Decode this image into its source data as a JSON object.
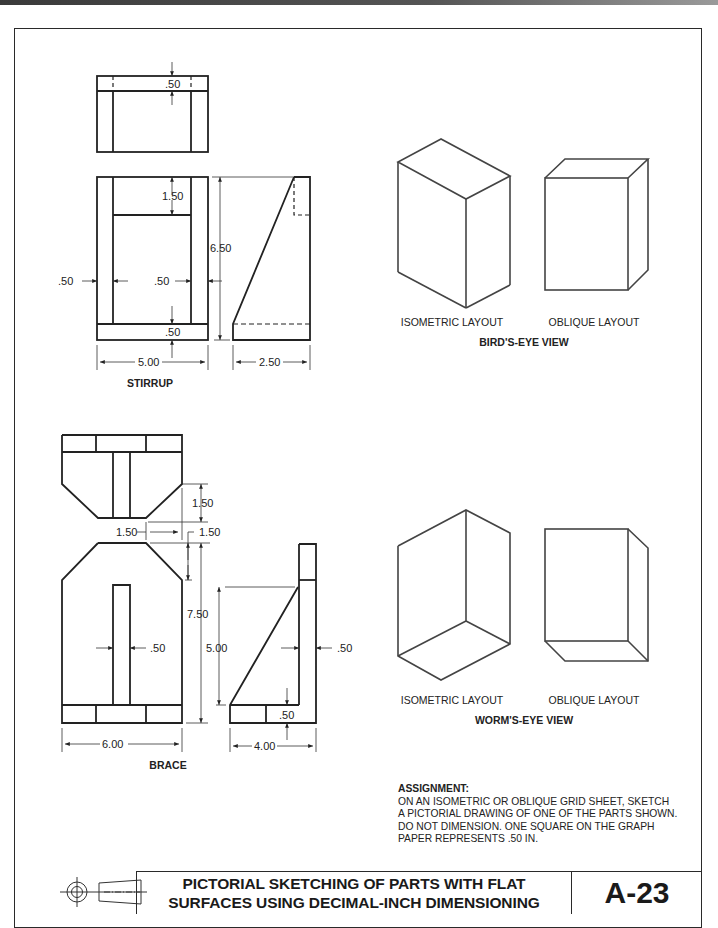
{
  "page": {
    "sheet_number": "A-23",
    "title_lines": [
      "PICTORIAL SKETCHING OF PARTS WITH FLAT",
      "SURFACES USING DECIMAL-INCH DIMENSIONING"
    ]
  },
  "stirrup": {
    "label": "STIRRUP",
    "dims": {
      "top_thickness": ".50",
      "top_gap": "1.50",
      "height": "6.50",
      "left_wall": ".50",
      "right_wall": ".50",
      "base_thickness": ".50",
      "width": "5.00",
      "depth": "2.50"
    }
  },
  "brace": {
    "label": "BRACE",
    "dims": {
      "chamfer_height": "1.50",
      "chamfer_width": "1.50",
      "chamfer_side": "1.50",
      "height": "7.50",
      "rib_thickness": ".50",
      "rib_height": "5.00",
      "wall_thickness": ".50",
      "base_thickness": ".50",
      "width": "6.00",
      "depth": "4.00"
    }
  },
  "birds_eye": {
    "title": "BIRD'S-EYE VIEW",
    "isometric_label": "ISOMETRIC LAYOUT",
    "oblique_label": "OBLIQUE LAYOUT"
  },
  "worms_eye": {
    "title": "WORM'S-EYE VIEW",
    "isometric_label": "ISOMETRIC LAYOUT",
    "oblique_label": "OBLIQUE LAYOUT"
  },
  "assignment": {
    "heading": "ASSIGNMENT:",
    "lines": [
      "ON AN ISOMETRIC OR OBLIQUE GRID SHEET, SKETCH",
      "A PICTORIAL DRAWING OF ONE OF THE PARTS SHOWN.",
      "DO NOT DIMENSION. ONE SQUARE ON THE GRAPH",
      "PAPER REPRESENTS .50 IN."
    ]
  },
  "icons": {
    "projection_symbol": "third-angle-projection-symbol"
  }
}
